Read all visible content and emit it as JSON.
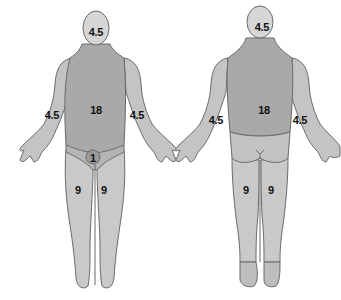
{
  "diagram": {
    "type": "rule-of-nines body surface area chart",
    "colors": {
      "skin_light": "#d4d4d4",
      "skin_mid": "#bdbdbd",
      "trunk": "#a9a9a9",
      "outline": "#6b6b6b",
      "perineum": "#9a9a9a"
    },
    "front": {
      "head": "4.5",
      "trunk": "18",
      "left_arm": "4.5",
      "right_arm": "4.5",
      "perineum": "1",
      "left_leg": "9",
      "right_leg": "9"
    },
    "back": {
      "head": "4.5",
      "trunk": "18",
      "left_arm": "4.5",
      "right_arm": "4.5",
      "left_leg": "9",
      "right_leg": "9"
    }
  }
}
